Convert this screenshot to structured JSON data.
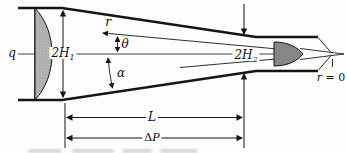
{
  "figure": {
    "colors": {
      "line": "#151515",
      "background": "#fdfdfc",
      "inlet_profile_fill": "#bdbdbd",
      "inlet_profile_dot": "#7f7f7f",
      "outlet_profile_fill": "#8e8e8e",
      "outlet_profile_dot": "#5f5f5f"
    },
    "labels": {
      "q": "q",
      "h1_main": "2H",
      "h1_sub": "1",
      "r": "r",
      "theta": "θ",
      "alpha": "α",
      "h2_main": "2H",
      "h2_sub": "2",
      "r0_var": "r",
      "r0_eq": "= 0",
      "length": "L",
      "dp_delta": "Δ",
      "dp_var": "P"
    }
  }
}
